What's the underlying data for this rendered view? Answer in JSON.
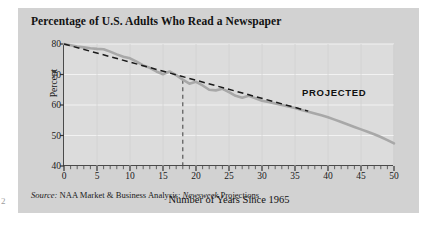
{
  "chart_data": {
    "type": "line",
    "title": "Percentage of U.S. Adults Who Read a Newspaper",
    "xlabel": "Number of Years Since 1965",
    "ylabel": "Percent",
    "xlim": [
      0,
      50
    ],
    "ylim": [
      40,
      80
    ],
    "xticks": [
      0,
      5,
      10,
      15,
      20,
      25,
      30,
      35,
      40,
      45,
      50
    ],
    "yticks": [
      40,
      50,
      60,
      70,
      80
    ],
    "minor_x_tick_step": 1,
    "grid": "horizontal-and-vertical-faint",
    "legend": "none",
    "annotations": [
      {
        "text": "PROJECTED",
        "x": 29,
        "y": 68
      }
    ],
    "source": "Source: NAA Market & Business Analysis; Newsweek Projections",
    "series": [
      {
        "name": "Percent of U.S. adults who read a newspaper",
        "color": "#a8a8a8",
        "style": "solid",
        "x": [
          0,
          1,
          2,
          3,
          4,
          5,
          6,
          7,
          8,
          9,
          10,
          11,
          12,
          13,
          14,
          15,
          16,
          17,
          18,
          19,
          20,
          21,
          22,
          23,
          24,
          25,
          26,
          27,
          28,
          29,
          30,
          31,
          32,
          33,
          34,
          35,
          36,
          37,
          38,
          39,
          40,
          41,
          42,
          43,
          44,
          45,
          46,
          47,
          48,
          49,
          50
        ],
        "y": [
          80.0,
          79.6,
          79.2,
          78.9,
          78.6,
          78.4,
          78.3,
          77.5,
          76.6,
          75.8,
          75.3,
          74.2,
          73.0,
          72.2,
          71.0,
          70.1,
          71.0,
          69.8,
          68.3,
          67.0,
          67.6,
          66.4,
          65.0,
          64.8,
          65.3,
          64.2,
          63.0,
          62.4,
          63.0,
          62.2,
          61.4,
          61.0,
          60.5,
          60.0,
          59.5,
          59.0,
          58.4,
          57.8,
          57.2,
          56.6,
          56.0,
          55.2,
          54.4,
          53.6,
          52.8,
          52.0,
          51.2,
          50.4,
          49.5,
          48.5,
          47.4
        ]
      },
      {
        "name": "Linear trend line",
        "color": "#1a1a1a",
        "style": "dashed",
        "x": [
          0,
          37
        ],
        "y": [
          80.0,
          58.0
        ]
      }
    ],
    "reference_lines": [
      {
        "name": "projection-start",
        "orientation": "vertical",
        "x": 18,
        "y_from": 40,
        "y_to": 68.3,
        "style": "dashed",
        "color": "#4a4a4a"
      }
    ]
  },
  "title": "Percentage of U.S. Adults Who Read a Newspaper",
  "axes": {
    "x_title": "Number of Years Since 1965",
    "y_title": "Percent",
    "x_tick_labels": [
      "0",
      "5",
      "10",
      "15",
      "20",
      "25",
      "30",
      "35",
      "40",
      "45",
      "50"
    ],
    "y_tick_labels": [
      "40",
      "50",
      "60",
      "70",
      "80"
    ]
  },
  "annotation": {
    "projected": "PROJECTED"
  },
  "source": {
    "prefix": "Source:",
    "body_before": " NAA Market & Business Analysis; ",
    "italic_publication": "Newsweek",
    "body_after": " Projections"
  },
  "artifact": {
    "page_mark": "2"
  },
  "colors": {
    "panel_background": "#d2d2d2",
    "plot_background": "#dcdcdc",
    "axis": "#4a4a4a",
    "data_line": "#a8a8a8",
    "trend_line": "#1a1a1a",
    "gridline": "#efefef",
    "text": "#111111"
  }
}
